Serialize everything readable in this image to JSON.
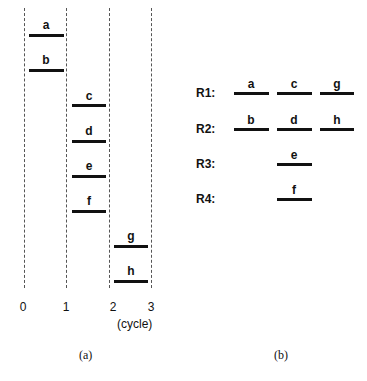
{
  "panel_a": {
    "caption": "(a)",
    "axis_ticks": [
      "0",
      "1",
      "2",
      "3"
    ],
    "axis_unit": "(cycle)",
    "tasks": [
      {
        "label": "a",
        "start": 0,
        "end": 1
      },
      {
        "label": "b",
        "start": 0,
        "end": 1
      },
      {
        "label": "c",
        "start": 1,
        "end": 2
      },
      {
        "label": "d",
        "start": 1,
        "end": 2
      },
      {
        "label": "e",
        "start": 1,
        "end": 2
      },
      {
        "label": "f",
        "start": 1,
        "end": 2
      },
      {
        "label": "g",
        "start": 2,
        "end": 3
      },
      {
        "label": "h",
        "start": 2,
        "end": 3
      }
    ]
  },
  "panel_b": {
    "caption": "(b)",
    "rows": [
      {
        "name": "R1:",
        "slots": [
          "a",
          "c",
          "g"
        ]
      },
      {
        "name": "R2:",
        "slots": [
          "b",
          "d",
          "h"
        ]
      },
      {
        "name": "R3:",
        "slots": [
          "",
          "e",
          ""
        ]
      },
      {
        "name": "R4:",
        "slots": [
          "",
          "f",
          ""
        ]
      }
    ]
  }
}
